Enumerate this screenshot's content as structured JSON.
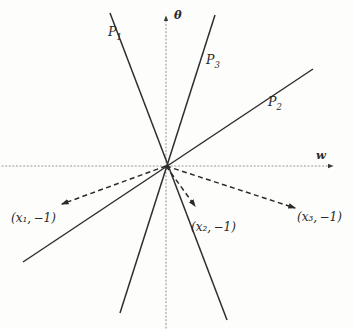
{
  "figure": {
    "caption": "",
    "background_color": "#fdfdfc",
    "line_color": "#2a2a2a",
    "axis_color": "#8a8a8a"
  },
  "axes": {
    "vertical": {
      "label": "θ",
      "name": "theta",
      "style": "dotted",
      "arrow": "up"
    },
    "horizontal": {
      "label": "w",
      "name": "w",
      "style": "dotted",
      "arrow": "right"
    },
    "origin": {
      "x": 166,
      "y": 166
    }
  },
  "lines": [
    {
      "id": "P1",
      "label": "P",
      "subscript": "1",
      "x1": 110,
      "y1": 13,
      "x2": 227,
      "y2": 320
    },
    {
      "id": "P3",
      "label": "P",
      "subscript": "3",
      "x1": 215,
      "y1": 15,
      "x2": 120,
      "y2": 313
    },
    {
      "id": "P2",
      "label": "P",
      "subscript": "2",
      "x1": 313,
      "y1": 69,
      "x2": 23,
      "y2": 262
    }
  ],
  "line_labels": [
    {
      "for": "P1",
      "text": "P",
      "sub": "1",
      "x": 108,
      "y": 27
    },
    {
      "for": "P3",
      "text": "P",
      "sub": "3",
      "x": 206,
      "y": 55
    },
    {
      "for": "P2",
      "text": "P",
      "sub": "2",
      "x": 268,
      "y": 97
    }
  ],
  "vectors": [
    {
      "id": "v1",
      "from_x": 166,
      "from_y": 166,
      "to_x": 60,
      "to_y": 205,
      "style": "dashed",
      "arrow": true
    },
    {
      "id": "v2",
      "from_x": 166,
      "from_y": 166,
      "to_x": 196,
      "to_y": 208,
      "style": "dashed",
      "arrow": true
    },
    {
      "id": "v3",
      "from_x": 166,
      "from_y": 166,
      "to_x": 297,
      "to_y": 209,
      "style": "dashed",
      "arrow": true
    }
  ],
  "point_labels": [
    {
      "id": "pt1",
      "var": "x",
      "sub": "1",
      "value": "−1",
      "text": "(x₁, −1)",
      "x": 11,
      "y": 212
    },
    {
      "id": "pt2",
      "var": "x",
      "sub": "2",
      "value": "−1",
      "text": "(x₂, −1)",
      "x": 191,
      "y": 221
    },
    {
      "id": "pt3",
      "var": "x",
      "sub": "3",
      "value": "−1",
      "text": "(x₃, −1)",
      "x": 297,
      "y": 211
    }
  ],
  "axis_labels": {
    "theta": {
      "text": "θ",
      "x": 174,
      "y": 12
    },
    "w": {
      "text": "w",
      "x": 316,
      "y": 150
    }
  }
}
